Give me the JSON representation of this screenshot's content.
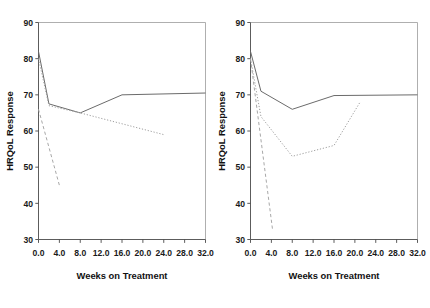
{
  "figure": {
    "background": "#ffffff",
    "panel_count": 2
  },
  "chart_data": [
    {
      "type": "line",
      "panel": "left",
      "title": "",
      "xlabel": "Weeks on Treatment",
      "ylabel": "HRQoL Response",
      "xlim": [
        0.0,
        32.0
      ],
      "ylim": [
        30,
        90
      ],
      "xticks": [
        "0.0",
        "4.0",
        "8.0",
        "12.0",
        "16.0",
        "20.0",
        "24.0",
        "28.0",
        "32.0"
      ],
      "xtick_values": [
        0,
        4,
        8,
        12,
        16,
        20,
        24,
        28,
        32
      ],
      "yticks": [
        "90",
        "80",
        "70",
        "60",
        "50",
        "40",
        "30"
      ],
      "ytick_values": [
        90,
        80,
        70,
        60,
        50,
        40,
        30
      ],
      "grid": false,
      "legend": "none",
      "series": [
        {
          "name": "solid-series",
          "style": "solid",
          "color": "#6b6b6b",
          "x": [
            0,
            2,
            8,
            16,
            32
          ],
          "y": [
            82.0,
            67.5,
            65.0,
            70.0,
            70.5
          ]
        },
        {
          "name": "dotted-series",
          "style": "dotted",
          "color": "#9e9e9e",
          "x": [
            0,
            2,
            8,
            24
          ],
          "y": [
            80.0,
            67.0,
            65.0,
            59.0
          ]
        },
        {
          "name": "dashed-series",
          "style": "dashed",
          "color": "#a8a8a8",
          "x": [
            0,
            4
          ],
          "y": [
            66.0,
            45.0
          ]
        }
      ]
    },
    {
      "type": "line",
      "panel": "right",
      "title": "",
      "xlabel": "Weeks on Treatment",
      "ylabel": "HRQoL Response",
      "xlim": [
        0.0,
        32.0
      ],
      "ylim": [
        30,
        90
      ],
      "xticks": [
        "0.0",
        "4.0",
        "8.0",
        "12.0",
        "16.0",
        "20.0",
        "24.0",
        "28.0",
        "32.0"
      ],
      "xtick_values": [
        0,
        4,
        8,
        12,
        16,
        20,
        24,
        28,
        32
      ],
      "yticks": [
        "90",
        "80",
        "70",
        "60",
        "50",
        "40",
        "30"
      ],
      "ytick_values": [
        90,
        80,
        70,
        60,
        50,
        40,
        30
      ],
      "grid": false,
      "legend": "none",
      "series": [
        {
          "name": "solid-series",
          "style": "solid",
          "color": "#6b6b6b",
          "x": [
            0,
            2,
            8,
            16,
            32
          ],
          "y": [
            82.0,
            71.0,
            66.0,
            69.8,
            70.0
          ]
        },
        {
          "name": "dotted-series",
          "style": "dotted",
          "color": "#9e9e9e",
          "x": [
            0,
            2,
            8,
            16,
            21
          ],
          "y": [
            80.0,
            64.0,
            53.0,
            56.0,
            68.0
          ]
        },
        {
          "name": "dashed-series",
          "style": "dashed",
          "color": "#a8a8a8",
          "x": [
            0,
            4.2
          ],
          "y": [
            80.0,
            33.0
          ]
        }
      ]
    }
  ]
}
